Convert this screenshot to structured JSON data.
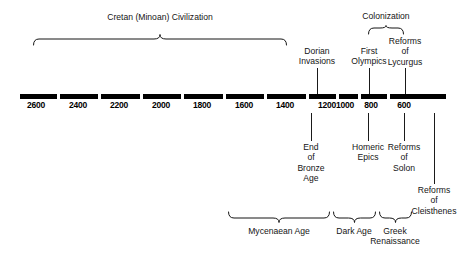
{
  "figure": {
    "background_color": "#ffffff",
    "ink_color": "#151515",
    "axis_color": "#000000"
  },
  "axis": {
    "label": "Years BC",
    "direction": "decreasing",
    "start_value": 2600,
    "end_value": 600,
    "ticks": [
      {
        "label": "2600",
        "value": 2600,
        "x": 36
      },
      {
        "label": "2400",
        "value": 2400,
        "x": 78
      },
      {
        "label": "2200",
        "value": 2200,
        "x": 119
      },
      {
        "label": "2000",
        "value": 2000,
        "x": 161
      },
      {
        "label": "1800",
        "value": 1800,
        "x": 202
      },
      {
        "label": "1600",
        "value": 1600,
        "x": 244
      },
      {
        "label": "1400",
        "value": 1400,
        "x": 285
      },
      {
        "label": "1200",
        "value": 1200,
        "x": 327
      },
      {
        "label": "1000",
        "value": 1000,
        "x": 345
      },
      {
        "label": "800",
        "value": 800,
        "x": 371
      },
      {
        "label": "600",
        "value": 600,
        "x": 404
      }
    ],
    "gaps_x": [
      57,
      98,
      140,
      181,
      223,
      264,
      306,
      336,
      358,
      387
    ]
  },
  "events_above": [
    {
      "name": "dorian-invasions",
      "lines": [
        "Dorian",
        "Invasions"
      ],
      "text": "Dorian\nInvasions",
      "x": 317,
      "text_top": 46,
      "lead_top": 68,
      "lead_height": 26
    },
    {
      "name": "first-olympics",
      "lines": [
        "First",
        "Olympics"
      ],
      "text": "First\nOlympics",
      "x": 369,
      "text_top": 46,
      "lead_top": 68,
      "lead_height": 26
    },
    {
      "name": "reforms-of-lycurgus",
      "lines": [
        "Reforms",
        "of",
        "Lycurgus"
      ],
      "text": "Reforms\nof\nLycurgus",
      "x": 405,
      "text_top": 36,
      "lead_top": 68,
      "lead_height": 26
    }
  ],
  "events_below": [
    {
      "name": "end-of-bronze-age",
      "lines": [
        "End",
        "of",
        "Bronze",
        "Age"
      ],
      "text": "End\nof\nBronze\nAge",
      "x": 311,
      "text_top": 142,
      "lead_top": 113,
      "lead_height": 28
    },
    {
      "name": "homeric-epics",
      "lines": [
        "Homeric",
        "Epics"
      ],
      "text": "Homeric\nEpics",
      "x": 368,
      "text_top": 142,
      "lead_top": 113,
      "lead_height": 28
    },
    {
      "name": "reforms-of-solon",
      "lines": [
        "Reforms",
        "of",
        "Solon"
      ],
      "text": "Reforms\nof\nSolon",
      "x": 404,
      "text_top": 142,
      "lead_top": 113,
      "lead_height": 28
    },
    {
      "name": "reforms-of-cleisthenes",
      "lines": [
        "Reforms",
        "of",
        "Cleisthenes"
      ],
      "text": "Reforms\nof\nCleisthenes",
      "x": 434,
      "text_top": 185,
      "lead_top": 113,
      "lead_height": 71
    }
  ],
  "period_braces": [
    {
      "name": "cretan-minoan-civilization",
      "label": "Cretan (Minoan) Civilization",
      "orientation": "up",
      "left": 33,
      "right": 287,
      "top": 34,
      "height": 11,
      "label_top": 12,
      "label_center": 160
    },
    {
      "name": "colonization",
      "label": "Colonization",
      "orientation": "up",
      "left": 368,
      "right": 404,
      "top": 25,
      "height": 9,
      "label_top": 11,
      "label_center": 386
    },
    {
      "name": "mycenaean-age",
      "label": "Mycenaean Age",
      "orientation": "down",
      "left": 228,
      "right": 330,
      "top": 212,
      "height": 11,
      "label_top": 226,
      "label_center": 279
    },
    {
      "name": "dark-age",
      "label": "Dark Age",
      "orientation": "down",
      "left": 333,
      "right": 376,
      "top": 212,
      "height": 11,
      "label_top": 226,
      "label_center": 354
    },
    {
      "name": "greek-renaissance",
      "label": "Greek\nRenaissance",
      "lines": [
        "Greek",
        "Renaissance"
      ],
      "orientation": "down",
      "left": 379,
      "right": 412,
      "top": 212,
      "height": 11,
      "label_top": 226,
      "label_center": 395
    }
  ]
}
